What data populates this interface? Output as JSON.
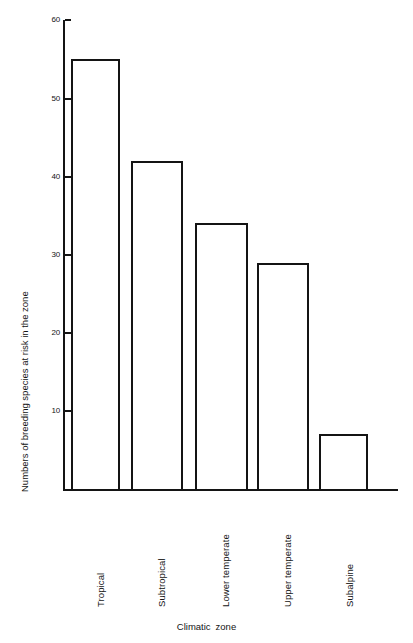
{
  "chart_data": {
    "type": "bar",
    "title": "",
    "subtitle": "",
    "xlabel": "Climatic zone",
    "xlabel_word1": "Climatic",
    "xlabel_word2": "zone",
    "ylabel": "Numbers of breeding species at risk in the zone",
    "categories": [
      "Tropical",
      "Subtropical",
      "Lower temperate",
      "Upper temperate",
      "Subalpine"
    ],
    "values": [
      55,
      42,
      34,
      29,
      7
    ],
    "ylim": [
      0,
      60
    ],
    "xlim_note": "categorical",
    "y_ticks": [
      10,
      20,
      30,
      40,
      50,
      60
    ],
    "y_tick_labels": [
      "10",
      "20",
      "30",
      "40",
      "50",
      "60"
    ],
    "grid": false,
    "legend": false,
    "legend_position": "none",
    "series": [
      {
        "name": "Numbers of breeding species at risk in the zone",
        "values": [
          55,
          42,
          34,
          29,
          7
        ]
      }
    ],
    "bar_fill_color": "#ffffff",
    "bar_edge_color": "#141414",
    "axis_color": "#141414",
    "background_color": "#ffffff"
  },
  "geometry": {
    "bars": [
      {
        "label": "Tropical",
        "value": 55,
        "left": 71,
        "width": 49,
        "label_left": 96,
        "label_top": 607
      },
      {
        "label": "Subtropical",
        "value": 42,
        "left": 131,
        "width": 52,
        "label_left": 157,
        "label_top": 607
      },
      {
        "label": "Lower temperate",
        "value": 34,
        "left": 195,
        "width": 53,
        "label_left": 221,
        "label_top": 607
      },
      {
        "label": "Upper temperate",
        "value": 29,
        "left": 257,
        "width": 52,
        "label_left": 283,
        "label_top": 607
      },
      {
        "label": "Subalpine",
        "value": 7,
        "left": 319,
        "width": 49,
        "label_left": 345,
        "label_top": 607
      }
    ],
    "baseline_y": 489,
    "px_per_unit": 7.81,
    "ticks": [
      {
        "label": "10",
        "value": 10
      },
      {
        "label": "20",
        "value": 20
      },
      {
        "label": "30",
        "value": 30
      },
      {
        "label": "40",
        "value": 40
      },
      {
        "label": "50",
        "value": 50
      },
      {
        "label": "60",
        "value": 60
      }
    ]
  }
}
